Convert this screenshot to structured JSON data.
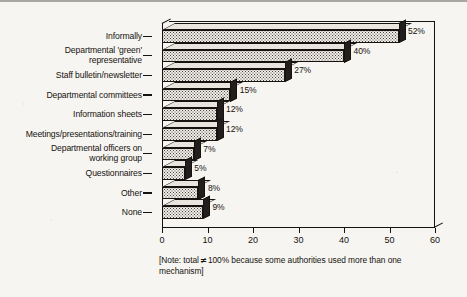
{
  "chart_data": {
    "type": "bar",
    "orientation": "horizontal",
    "title": "",
    "subtitle": "",
    "xlabel": "",
    "ylabel": "",
    "xlim": [
      0,
      60
    ],
    "x_ticks": [
      0,
      10,
      20,
      30,
      40,
      50,
      60
    ],
    "x_tick_labels": [
      "0",
      "10",
      "20",
      "30",
      "40",
      "50",
      "60"
    ],
    "grid": false,
    "legend": false,
    "value_suffix": "%",
    "categories": [
      "Informally",
      "Departmental 'green'\nrepresentative",
      "Staff bulletin/newsletter",
      "Departmental committees",
      "Information sheets",
      "Meetings/presentations/training",
      "Departmental officers on\nworking group",
      "Questionnaires",
      "Other",
      "None"
    ],
    "values": [
      52,
      40,
      27,
      15,
      12,
      12,
      7,
      5,
      8,
      9
    ],
    "value_labels": [
      "52%",
      "40%",
      "27%",
      "15%",
      "12%",
      "12%",
      "7%",
      "5%",
      "8%",
      "9%"
    ],
    "annotations": [
      "[Note: total ≠ 100% because some authorities used more than one mechanism]"
    ]
  },
  "note": {
    "prefix": "[Note: total",
    "symbol": "≠",
    "suffix": "100% because some authorities used more than one mechanism]"
  },
  "colors": {
    "page_background": "#f7f5f1",
    "ink": "#15120f",
    "bar_face": "#efece6",
    "bar_stipple": "#4a4540",
    "bar_side_dark": "#211e1b",
    "bar_top_light": "#e9e5de"
  }
}
